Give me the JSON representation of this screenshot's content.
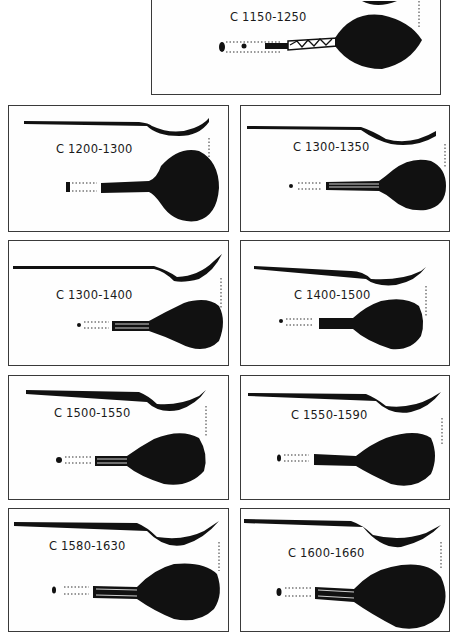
{
  "figure": {
    "colors": {
      "ink": "#111111",
      "border": "#3a3a3a",
      "background": "#ffffff"
    },
    "panels": [
      {
        "id": "p0",
        "label": "C 1150-1250",
        "handle": "decorated-stem"
      },
      {
        "id": "p1",
        "label": "C 1200-1300",
        "handle": "flat-stem"
      },
      {
        "id": "p2",
        "label": "C 1300-1350",
        "handle": "thin-stem"
      },
      {
        "id": "p3",
        "label": "C 1300-1400",
        "handle": "thin-stem"
      },
      {
        "id": "p4",
        "label": "C 1400-1500",
        "handle": "thin-stem"
      },
      {
        "id": "p5",
        "label": "C 1500-1550",
        "handle": "thin-stem"
      },
      {
        "id": "p6",
        "label": "C 1550-1590",
        "handle": "flat-stem"
      },
      {
        "id": "p7",
        "label": "C 1580-1630",
        "handle": "flat-stem"
      },
      {
        "id": "p8",
        "label": "C 1600-1660",
        "handle": "flat-stem"
      }
    ]
  }
}
